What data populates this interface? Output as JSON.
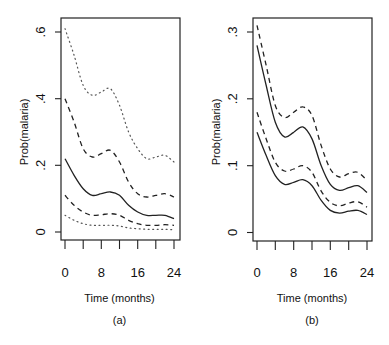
{
  "chart_data": [
    {
      "type": "line",
      "panel_label": "(a)",
      "title": "",
      "xlabel": "Time (months)",
      "ylabel": "Prob(malaria)",
      "x_ticks": [
        "0",
        "8",
        "16",
        "24"
      ],
      "y_ticks": [
        "0",
        ".2",
        ".4",
        ".6"
      ],
      "xlim": [
        0,
        24
      ],
      "ylim": [
        0,
        0.6
      ],
      "grid": false,
      "x": [
        0,
        2,
        4,
        6,
        8,
        10,
        12,
        14,
        16,
        18,
        20,
        22,
        24
      ],
      "series": [
        {
          "name": "upper dotted",
          "style": "dotted",
          "values": [
            0.61,
            0.53,
            0.44,
            0.41,
            0.42,
            0.43,
            0.38,
            0.3,
            0.25,
            0.22,
            0.225,
            0.23,
            0.21
          ]
        },
        {
          "name": "upper dashed",
          "style": "dashed",
          "values": [
            0.4,
            0.33,
            0.25,
            0.225,
            0.235,
            0.245,
            0.21,
            0.15,
            0.115,
            0.105,
            0.11,
            0.115,
            0.105
          ]
        },
        {
          "name": "solid",
          "style": "solid",
          "values": [
            0.22,
            0.17,
            0.13,
            0.11,
            0.115,
            0.12,
            0.11,
            0.08,
            0.06,
            0.05,
            0.05,
            0.05,
            0.04
          ]
        },
        {
          "name": "lower dashed",
          "style": "dashed",
          "values": [
            0.11,
            0.08,
            0.06,
            0.05,
            0.052,
            0.055,
            0.05,
            0.035,
            0.025,
            0.02,
            0.02,
            0.022,
            0.02
          ]
        },
        {
          "name": "lower dotted",
          "style": "dotted",
          "values": [
            0.05,
            0.035,
            0.025,
            0.02,
            0.02,
            0.02,
            0.018,
            0.012,
            0.01,
            0.008,
            0.008,
            0.008,
            0.007
          ]
        }
      ]
    },
    {
      "type": "line",
      "panel_label": "(b)",
      "title": "",
      "xlabel": "Time (months)",
      "ylabel": "Prob(malaria)",
      "x_ticks": [
        "0",
        "8",
        "16",
        "24"
      ],
      "y_ticks": [
        "0",
        ".1",
        ".2",
        ".3"
      ],
      "xlim": [
        0,
        24
      ],
      "ylim": [
        0,
        0.3
      ],
      "grid": false,
      "x": [
        0,
        2,
        4,
        6,
        8,
        10,
        12,
        14,
        16,
        18,
        20,
        22,
        24
      ],
      "series": [
        {
          "name": "upper dashed",
          "style": "dashed",
          "values": [
            0.31,
            0.25,
            0.19,
            0.172,
            0.18,
            0.188,
            0.175,
            0.13,
            0.095,
            0.083,
            0.088,
            0.09,
            0.078
          ]
        },
        {
          "name": "upper solid",
          "style": "solid",
          "values": [
            0.28,
            0.22,
            0.165,
            0.143,
            0.15,
            0.158,
            0.14,
            0.1,
            0.072,
            0.063,
            0.067,
            0.07,
            0.06
          ]
        },
        {
          "name": "lower dashed",
          "style": "dashed",
          "values": [
            0.18,
            0.14,
            0.105,
            0.092,
            0.095,
            0.1,
            0.09,
            0.062,
            0.045,
            0.04,
            0.044,
            0.046,
            0.038
          ]
        },
        {
          "name": "lower solid",
          "style": "solid",
          "values": [
            0.15,
            0.115,
            0.085,
            0.072,
            0.075,
            0.079,
            0.07,
            0.048,
            0.033,
            0.029,
            0.032,
            0.033,
            0.027
          ]
        }
      ]
    }
  ]
}
